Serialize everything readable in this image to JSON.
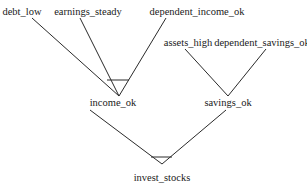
{
  "diagram": {
    "type": "and-tree",
    "line_color": "#2a2a2a",
    "nodes": [
      {
        "id": "debt_low",
        "label": "debt_low",
        "x": 22,
        "y": 6
      },
      {
        "id": "earnings_steady",
        "label": "earnings_steady",
        "x": 88,
        "y": 6
      },
      {
        "id": "dependent_income_ok",
        "label": "dependent_income_ok",
        "x": 197,
        "y": 6
      },
      {
        "id": "assets_high",
        "label": "assets_high",
        "x": 188,
        "y": 37
      },
      {
        "id": "dependent_savings_ok",
        "label": "dependent_savings_ok",
        "x": 262,
        "y": 37
      },
      {
        "id": "income_ok",
        "label": "income_ok",
        "x": 119,
        "y": 97
      },
      {
        "id": "savings_ok",
        "label": "savings_ok",
        "x": 228,
        "y": 97
      },
      {
        "id": "invest_stocks",
        "label": "invest_stocks",
        "x": 162,
        "y": 172
      }
    ],
    "edges": [
      {
        "from": "debt_low",
        "to": "income_ok"
      },
      {
        "from": "earnings_steady",
        "to": "income_ok"
      },
      {
        "from": "dependent_income_ok",
        "to": "income_ok"
      },
      {
        "from": "assets_high",
        "to": "savings_ok"
      },
      {
        "from": "dependent_savings_ok",
        "to": "savings_ok"
      },
      {
        "from": "income_ok",
        "to": "invest_stocks"
      },
      {
        "from": "savings_ok",
        "to": "invest_stocks"
      }
    ],
    "and_arcs": [
      "income_ok",
      "invest_stocks"
    ]
  }
}
